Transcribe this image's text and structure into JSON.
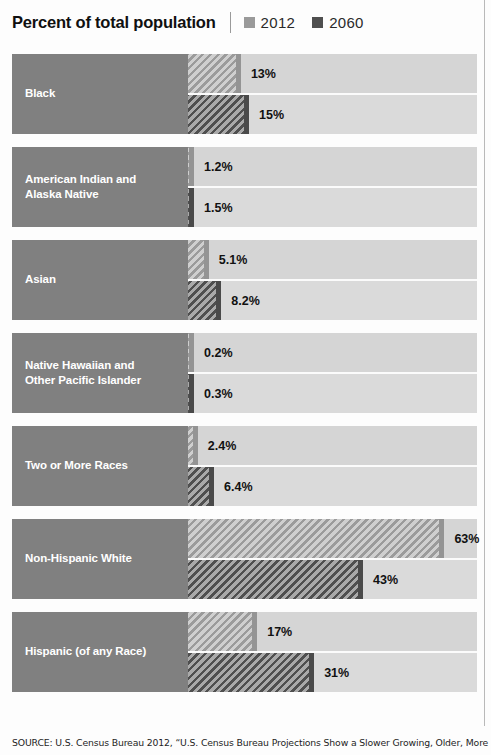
{
  "header": {
    "title": "Percent of total population",
    "legend": [
      {
        "label": "2012",
        "color": "#9a9a9a"
      },
      {
        "label": "2060",
        "color": "#4f4f4f"
      }
    ]
  },
  "source": {
    "text": "SOURCE: U.S. Census Bureau 2012, “U.S. Census Bureau Projections Show a Slower Growing, Older, More"
  },
  "chart_data": {
    "type": "bar",
    "title": "Percent of total population",
    "xlabel": "",
    "ylabel": "",
    "orientation": "horizontal",
    "grid": false,
    "legend_position": "top-right",
    "xlim": [
      0,
      70
    ],
    "categories": [
      "Black",
      "American Indian and Alaska Native",
      "Asian",
      "Native Hawaiian and Other Pacific Islander",
      "Two or More Races",
      "Non-Hispanic White",
      "Hispanic (of any Race)"
    ],
    "series": [
      {
        "name": "2012",
        "color": "#9a9a9a",
        "values": [
          13,
          1.2,
          5.1,
          0.2,
          2.4,
          63,
          17
        ],
        "labels": [
          "13%",
          "1.2%",
          "5.1%",
          "0.2%",
          "2.4%",
          "63%",
          "17%"
        ]
      },
      {
        "name": "2060",
        "color": "#4f4f4f",
        "values": [
          15,
          1.5,
          8.2,
          0.3,
          6.4,
          43,
          31
        ],
        "labels": [
          "15%",
          "1.5%",
          "8.2%",
          "0.3%",
          "6.4%",
          "43%",
          "31%"
        ]
      }
    ]
  },
  "groups": [
    {
      "label_line1": "Black",
      "label_line2": "",
      "rows": [
        {
          "series": "2012",
          "value": 13,
          "label": "13%"
        },
        {
          "series": "2060",
          "value": 15,
          "label": "15%"
        }
      ]
    },
    {
      "label_line1": "American Indian and",
      "label_line2": "Alaska Native",
      "rows": [
        {
          "series": "2012",
          "value": 1.2,
          "label": "1.2%"
        },
        {
          "series": "2060",
          "value": 1.5,
          "label": "1.5%"
        }
      ]
    },
    {
      "label_line1": "Asian",
      "label_line2": "",
      "rows": [
        {
          "series": "2012",
          "value": 5.1,
          "label": "5.1%"
        },
        {
          "series": "2060",
          "value": 8.2,
          "label": "8.2%"
        }
      ]
    },
    {
      "label_line1": "Native Hawaiian and",
      "label_line2": "Other Pacific Islander",
      "rows": [
        {
          "series": "2012",
          "value": 0.2,
          "label": "0.2%"
        },
        {
          "series": "2060",
          "value": 0.3,
          "label": "0.3%"
        }
      ]
    },
    {
      "label_line1": "Two or More Races",
      "label_line2": "",
      "rows": [
        {
          "series": "2012",
          "value": 2.4,
          "label": "2.4%"
        },
        {
          "series": "2060",
          "value": 6.4,
          "label": "6.4%"
        }
      ]
    },
    {
      "label_line1": "Non-Hispanic White",
      "label_line2": "",
      "rows": [
        {
          "series": "2012",
          "value": 63,
          "label": "63%"
        },
        {
          "series": "2060",
          "value": 43,
          "label": "43%"
        }
      ]
    },
    {
      "label_line1": "Hispanic (of any Race)",
      "label_line2": "",
      "rows": [
        {
          "series": "2012",
          "value": 17,
          "label": "17%"
        },
        {
          "series": "2060",
          "value": 31,
          "label": "31%"
        }
      ]
    }
  ]
}
